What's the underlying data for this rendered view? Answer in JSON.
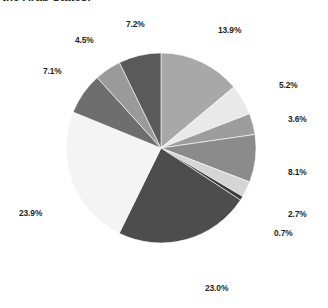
{
  "caption": {
    "text": "the Arab States."
  },
  "chart_data": {
    "type": "pie",
    "title": "",
    "subtitle": "",
    "xlabel": "",
    "ylabel": "",
    "legend": "none",
    "grid": false,
    "units": "percent",
    "start_angle_deg": 0,
    "direction": "clockwise",
    "total": 99.9,
    "categories": [
      "segment-1",
      "segment-2",
      "segment-3",
      "segment-4",
      "segment-5",
      "segment-6",
      "segment-7",
      "segment-8",
      "segment-9",
      "segment-10",
      "segment-11"
    ],
    "values": [
      13.9,
      5.2,
      3.6,
      8.1,
      2.7,
      0.7,
      23.0,
      23.9,
      7.1,
      4.5,
      7.2
    ],
    "labels": [
      "13.9%",
      "5.2%",
      "3.6%",
      "8.1%",
      "2.7%",
      "0.7%",
      "23.0%",
      "23.9%",
      "7.1%",
      "4.5%",
      "7.2%"
    ],
    "colors": [
      "#a8a8a8",
      "#e9e9e9",
      "#9d9d9d",
      "#8b8b8b",
      "#d5d5d5",
      "#3a3a3a",
      "#4d4d4d",
      "#f4f4f4",
      "#6e6e6e",
      "#9a9a9a",
      "#5a5a5a"
    ],
    "slices": [
      {
        "label": "13.9%",
        "value": 13.9,
        "color": "#a8a8a8",
        "label_x": 218,
        "label_y": 25
      },
      {
        "label": "5.2%",
        "value": 5.2,
        "color": "#e9e9e9",
        "label_x": 279,
        "label_y": 80
      },
      {
        "label": "3.6%",
        "value": 3.6,
        "color": "#9d9d9d",
        "label_x": 288,
        "label_y": 114
      },
      {
        "label": "8.1%",
        "value": 8.1,
        "color": "#8b8b8b",
        "label_x": 288,
        "label_y": 167
      },
      {
        "label": "2.7%",
        "value": 2.7,
        "color": "#d5d5d5",
        "label_x": 288,
        "label_y": 209
      },
      {
        "label": "0.7%",
        "value": 0.7,
        "color": "#3a3a3a",
        "label_x": 274,
        "label_y": 228
      },
      {
        "label": "23.0%",
        "value": 23.0,
        "color": "#4d4d4d",
        "label_x": 205,
        "label_y": 283
      },
      {
        "label": "23.9%",
        "value": 23.9,
        "color": "#f4f4f4",
        "label_x": 19,
        "label_y": 208
      },
      {
        "label": "7.1%",
        "value": 7.1,
        "color": "#6e6e6e",
        "label_x": 43,
        "label_y": 66
      },
      {
        "label": "4.5%",
        "value": 4.5,
        "color": "#9a9a9a",
        "label_x": 75,
        "label_y": 35
      },
      {
        "label": "7.2%",
        "value": 7.2,
        "color": "#5a5a5a",
        "label_x": 126,
        "label_y": 19
      }
    ],
    "geometry": {
      "center_x": 161,
      "center_y": 148,
      "radius": 95
    }
  }
}
